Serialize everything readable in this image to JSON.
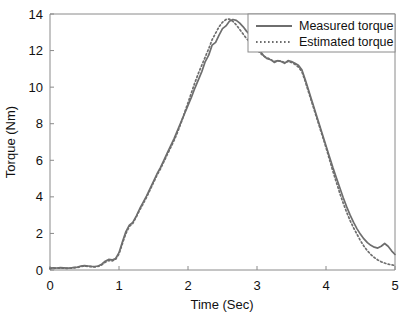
{
  "chart_data": {
    "type": "line",
    "title": "",
    "xlabel": "Time (Sec)",
    "ylabel": "Torque (Nm)",
    "xlim": [
      0,
      5
    ],
    "ylim": [
      0,
      14
    ],
    "xticks": [
      0,
      1,
      2,
      3,
      4,
      5
    ],
    "yticks": [
      0,
      2,
      4,
      6,
      8,
      10,
      12,
      14
    ],
    "xtick_labels": [
      "0",
      "1",
      "2",
      "3",
      "4",
      "5"
    ],
    "ytick_labels": [
      "0",
      "2",
      "4",
      "6",
      "8",
      "10",
      "12",
      "14"
    ],
    "grid": false,
    "legend_position": "top-right",
    "line_color": "#6e6e6e",
    "axis_color": "#8a8a8a",
    "x": [
      0.0,
      0.05,
      0.1,
      0.15,
      0.2,
      0.25,
      0.3,
      0.35,
      0.4,
      0.45,
      0.5,
      0.55,
      0.6,
      0.65,
      0.7,
      0.75,
      0.8,
      0.85,
      0.9,
      0.95,
      1.0,
      1.05,
      1.1,
      1.15,
      1.2,
      1.25,
      1.3,
      1.35,
      1.4,
      1.45,
      1.5,
      1.55,
      1.6,
      1.65,
      1.7,
      1.75,
      1.8,
      1.85,
      1.9,
      1.95,
      2.0,
      2.05,
      2.1,
      2.15,
      2.2,
      2.25,
      2.3,
      2.35,
      2.4,
      2.45,
      2.5,
      2.55,
      2.6,
      2.65,
      2.7,
      2.75,
      2.8,
      2.85,
      2.9,
      2.95,
      3.0,
      3.05,
      3.1,
      3.15,
      3.2,
      3.25,
      3.3,
      3.35,
      3.4,
      3.45,
      3.5,
      3.55,
      3.6,
      3.65,
      3.7,
      3.75,
      3.8,
      3.85,
      3.9,
      3.95,
      4.0,
      4.05,
      4.1,
      4.15,
      4.2,
      4.25,
      4.3,
      4.35,
      4.4,
      4.45,
      4.5,
      4.55,
      4.6,
      4.65,
      4.7,
      4.75,
      4.8,
      4.85,
      4.9,
      4.95,
      5.0
    ],
    "series": [
      {
        "name": "Measured torque",
        "style": "solid",
        "values": [
          0.1,
          0.12,
          0.11,
          0.13,
          0.12,
          0.1,
          0.11,
          0.14,
          0.16,
          0.22,
          0.24,
          0.22,
          0.2,
          0.19,
          0.22,
          0.32,
          0.48,
          0.58,
          0.55,
          0.62,
          0.95,
          1.55,
          2.1,
          2.45,
          2.6,
          2.95,
          3.35,
          3.7,
          4.05,
          4.45,
          4.85,
          5.25,
          5.6,
          6.0,
          6.4,
          6.8,
          7.2,
          7.65,
          8.1,
          8.55,
          9.0,
          9.45,
          9.95,
          10.4,
          10.85,
          11.4,
          11.75,
          12.3,
          12.45,
          12.85,
          13.2,
          13.35,
          13.6,
          13.7,
          13.65,
          13.5,
          13.3,
          13.05,
          12.85,
          12.55,
          12.25,
          11.95,
          11.7,
          11.55,
          11.5,
          11.35,
          11.45,
          11.4,
          11.3,
          11.45,
          11.4,
          11.3,
          11.2,
          10.95,
          10.4,
          9.8,
          9.2,
          8.6,
          8.0,
          7.4,
          6.8,
          6.2,
          5.6,
          5.05,
          4.5,
          3.95,
          3.45,
          3.0,
          2.6,
          2.25,
          1.95,
          1.7,
          1.5,
          1.35,
          1.25,
          1.2,
          1.3,
          1.45,
          1.3,
          1.05,
          0.85
        ]
      },
      {
        "name": "Estimated torque",
        "style": "dotted",
        "values": [
          0.08,
          0.09,
          0.1,
          0.11,
          0.1,
          0.09,
          0.1,
          0.12,
          0.14,
          0.19,
          0.21,
          0.2,
          0.18,
          0.17,
          0.2,
          0.28,
          0.42,
          0.52,
          0.5,
          0.58,
          0.88,
          1.45,
          2.0,
          2.38,
          2.55,
          2.9,
          3.28,
          3.62,
          3.98,
          4.38,
          4.78,
          5.18,
          5.52,
          5.92,
          6.32,
          6.7,
          7.1,
          7.55,
          8.05,
          8.6,
          9.15,
          9.7,
          10.25,
          10.75,
          11.2,
          11.65,
          12.1,
          12.6,
          12.95,
          13.3,
          13.55,
          13.7,
          13.72,
          13.6,
          13.4,
          13.15,
          12.9,
          12.65,
          12.45,
          12.25,
          12.05,
          11.85,
          11.7,
          11.6,
          11.5,
          11.4,
          11.45,
          11.42,
          11.35,
          11.4,
          11.35,
          11.25,
          11.1,
          10.85,
          10.3,
          9.7,
          9.1,
          8.5,
          7.9,
          7.3,
          6.7,
          6.05,
          5.4,
          4.8,
          4.2,
          3.65,
          3.15,
          2.7,
          2.3,
          1.95,
          1.6,
          1.3,
          1.05,
          0.85,
          0.68,
          0.55,
          0.45,
          0.38,
          0.32,
          0.28,
          0.25
        ]
      }
    ]
  },
  "legend": {
    "items": [
      {
        "label": "Measured torque",
        "style": "solid"
      },
      {
        "label": "Estimated torque",
        "style": "dotted"
      }
    ]
  }
}
